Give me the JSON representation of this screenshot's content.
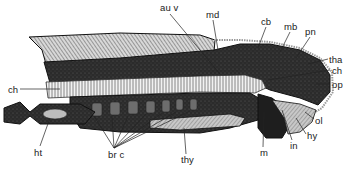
{
  "figure": {
    "type": "anatomical-section",
    "labels": [
      {
        "id": "au_v",
        "text": "au v",
        "x": 160,
        "y": 3
      },
      {
        "id": "md",
        "text": "md",
        "x": 206,
        "y": 10
      },
      {
        "id": "cb",
        "text": "cb",
        "x": 261,
        "y": 17
      },
      {
        "id": "mb",
        "text": "mb",
        "x": 284,
        "y": 22
      },
      {
        "id": "pn",
        "text": "pn",
        "x": 305,
        "y": 27
      },
      {
        "id": "tha",
        "text": "tha",
        "x": 329,
        "y": 55
      },
      {
        "id": "ch_right",
        "text": "ch",
        "x": 332,
        "y": 66
      },
      {
        "id": "op",
        "text": "op",
        "x": 332,
        "y": 80
      },
      {
        "id": "ol",
        "text": "ol",
        "x": 315,
        "y": 116
      },
      {
        "id": "hy",
        "text": "hy",
        "x": 307,
        "y": 131
      },
      {
        "id": "in",
        "text": "in",
        "x": 290,
        "y": 141
      },
      {
        "id": "m",
        "text": "m",
        "x": 260,
        "y": 148
      },
      {
        "id": "thy",
        "text": "thy",
        "x": 181,
        "y": 155
      },
      {
        "id": "br_c",
        "text": "br c",
        "x": 108,
        "y": 150
      },
      {
        "id": "ht",
        "text": "ht",
        "x": 34,
        "y": 148
      },
      {
        "id": "ch_left",
        "text": "ch",
        "x": 8,
        "y": 85
      }
    ]
  }
}
